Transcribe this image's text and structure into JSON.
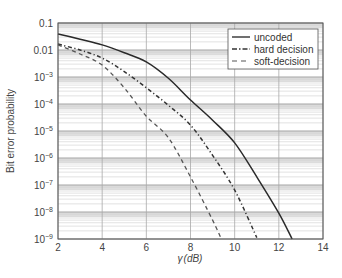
{
  "chart_data": {
    "type": "line",
    "title": "",
    "xlabel": "γ (dB)",
    "ylabel": "Bit error probability",
    "xlim": [
      2,
      14
    ],
    "ylim": [
      1e-09,
      0.1
    ],
    "yscale": "log",
    "grid": true,
    "legend_position": "upper right",
    "x_ticks": [
      "2",
      "4",
      "6",
      "8",
      "10",
      "12",
      "14"
    ],
    "y_ticks": [
      {
        "label": "0.1",
        "exp": -1
      },
      {
        "label": "0.01",
        "exp": -2
      },
      {
        "label": "10",
        "sup": "−3",
        "exp": -3
      },
      {
        "label": "10",
        "sup": "−4",
        "exp": -4
      },
      {
        "label": "10",
        "sup": "−5",
        "exp": -5
      },
      {
        "label": "10",
        "sup": "−6",
        "exp": -6
      },
      {
        "label": "10",
        "sup": "−7",
        "exp": -7
      },
      {
        "label": "10",
        "sup": "−8",
        "exp": -8
      },
      {
        "label": "10",
        "sup": "−9",
        "exp": -9
      }
    ],
    "series": [
      {
        "name": "uncoded",
        "style": "solid",
        "x": [
          2,
          3,
          4,
          5,
          6,
          7,
          8,
          9,
          10,
          11,
          12,
          12.6
        ],
        "log10_y": [
          -1.41,
          -1.6,
          -1.81,
          -2.1,
          -2.44,
          -3.05,
          -3.85,
          -4.6,
          -5.44,
          -6.7,
          -8.04,
          -9.0
        ],
        "values": [
          0.039,
          0.025,
          0.015,
          0.0079,
          0.0036,
          0.00089,
          0.00014,
          2.5e-05,
          3.6e-06,
          2e-07,
          9.1e-09,
          1e-09
        ]
      },
      {
        "name": "hard decision",
        "style": "dashdot",
        "x": [
          2,
          3,
          4,
          5,
          6,
          7,
          8,
          9,
          10,
          11
        ],
        "log10_y": [
          -1.78,
          -2.0,
          -2.3,
          -2.8,
          -3.4,
          -4.05,
          -4.78,
          -5.9,
          -7.19,
          -8.95
        ],
        "values": [
          0.017,
          0.01,
          0.005,
          0.0016,
          0.0004,
          8.9e-05,
          1.7e-05,
          1.3e-06,
          6.5e-08,
          1.1e-09
        ]
      },
      {
        "name": "soft-decision",
        "style": "dashed",
        "x": [
          2,
          3,
          4,
          5,
          6,
          7,
          8,
          9,
          9.4
        ],
        "log10_y": [
          -1.81,
          -2.15,
          -2.56,
          -3.4,
          -4.45,
          -5.25,
          -6.7,
          -8.3,
          -9.0
        ],
        "values": [
          0.015,
          0.0071,
          0.0028,
          0.0004,
          3.5e-05,
          5.6e-06,
          2e-07,
          5e-09,
          1e-09
        ]
      }
    ]
  },
  "legend": {
    "items": [
      "uncoded",
      "hard decision",
      "soft-decision"
    ]
  },
  "axes": {
    "xlabel_gamma": "γ",
    "xlabel_unit": "(dB)",
    "ylabel": "Bit error probability"
  }
}
